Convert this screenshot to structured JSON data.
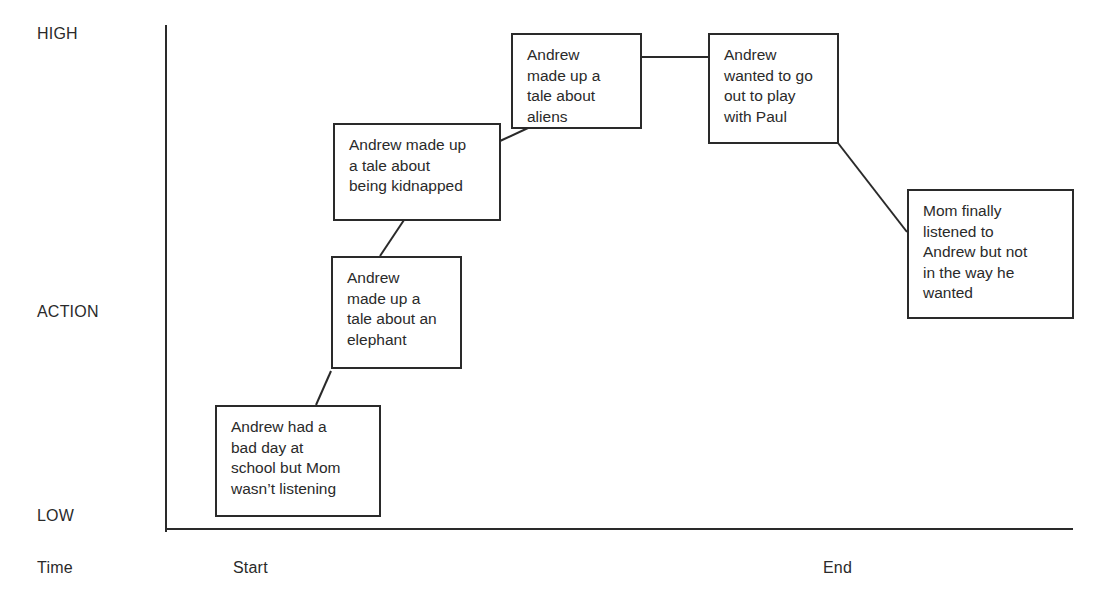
{
  "diagram": {
    "type": "story-plot-timeline",
    "y_axis": {
      "labels": {
        "high": "HIGH",
        "action": "ACTION",
        "low": "LOW"
      }
    },
    "x_axis": {
      "label": "Time",
      "start": "Start",
      "end": "End"
    },
    "events": [
      {
        "text": "Andrew had a\nbad day at\nschool but Mom\nwasn’t listening"
      },
      {
        "text": "Andrew\nmade up a\ntale about an\nelephant"
      },
      {
        "text": "Andrew made up\na tale about\nbeing kidnapped"
      },
      {
        "text": "Andrew\nmade up a\ntale about\naliens"
      },
      {
        "text": "Andrew\nwanted to go\nout to play\nwith Paul"
      },
      {
        "text": "Mom finally\nlistened to\nAndrew but not\nin the way he\nwanted"
      }
    ],
    "colors": {
      "line": "#2a2a2a",
      "text": "#2a2a2a",
      "background": "#ffffff"
    }
  }
}
